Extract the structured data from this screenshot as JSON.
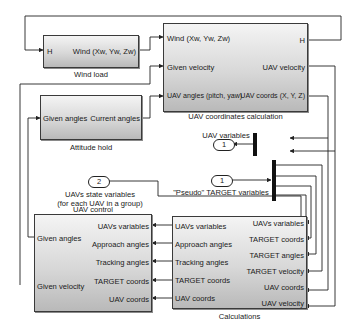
{
  "blocks": {
    "wind_load": {
      "caption": "Wind load",
      "inputs": [
        "H"
      ],
      "outputs": [
        "Wind (Xw, Yw, Zw)"
      ]
    },
    "uav_coords_calc": {
      "caption": "UAV coordinates calculation",
      "inputs": [
        "Wind (Xw, Yw, Zw)",
        "Given velocity",
        "UAV angles (pitch, yaw)"
      ],
      "outputs": [
        "H",
        "UAV velocity",
        "UAV coords (X, Y, Z)"
      ]
    },
    "attitude_hold": {
      "caption": "Attitude hold",
      "inputs": [
        "Given angles"
      ],
      "outputs": [
        "Current angles"
      ]
    },
    "uav_control": {
      "caption": "UAV control",
      "outputs": [
        "Given angles",
        "Given velocity"
      ],
      "inputs": [
        "UAVs variables",
        "Approach angles",
        "Tracking angles",
        "TARGET coords",
        "UAV coords"
      ]
    },
    "calculations": {
      "caption": "Calculations",
      "outputs": [
        "UAVs variables",
        "Approach angles",
        "Tracking angles",
        "TARGET coords",
        "UAV coords"
      ],
      "inputs": [
        "UAVs variables",
        "TARGET coords",
        "TARGET angles",
        "TARGET velocity",
        "UAV coords",
        "UAV velocity"
      ]
    }
  },
  "ports": {
    "uav_variables": {
      "number": "1",
      "label": "UAV variables"
    },
    "pseudo_target": {
      "number": "1",
      "label": "\"Pseudo\" TARGET variables"
    },
    "uavs_state": {
      "number": "2",
      "label_line1": "UAVs state variables",
      "label_line2": "(for each UAV in a group)"
    }
  },
  "colors": {
    "line": "#222222",
    "block_top": "#f4f4f4",
    "block_bottom": "#b9b9b9"
  }
}
